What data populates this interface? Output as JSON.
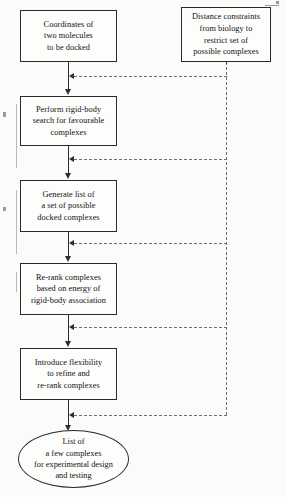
{
  "diagram": {
    "background_color": "#fbfbfa",
    "line_color": "#2f2f2f",
    "dashed_line_color": "#6f6f6f",
    "nodes": {
      "input_coordinates": {
        "label": "Coordinates of\ntwo molecules\nto be docked",
        "shape": "rectangle"
      },
      "distance_constraints": {
        "label": "Distance constraints\nfrom biology  to\nrestrict set of\npossible complexes",
        "shape": "rectangle"
      },
      "rigid_body_search": {
        "label": "Perform rigid-body\nsearch for favourable\ncomplexes",
        "shape": "rectangle"
      },
      "generate_list": {
        "label": "Generate list of\na set of possible\ndocked complexes",
        "shape": "rectangle"
      },
      "rerank_energy": {
        "label": "Re-rank complexes\nbased on energy of\nrigid-body association",
        "shape": "rectangle"
      },
      "introduce_flexibility": {
        "label": "Introduce flexibility\nto refine and\nre-rank complexes",
        "shape": "rectangle"
      },
      "output_list": {
        "label": "List of\na few complexes\nfor experimental design\nand testing",
        "shape": "ellipse"
      }
    },
    "edges": [
      {
        "name": "coordinates-to-rigid-search",
        "style": "solid",
        "direction": "down"
      },
      {
        "name": "rigid-search-to-generate-list",
        "style": "solid",
        "direction": "down"
      },
      {
        "name": "generate-list-to-rerank",
        "style": "solid",
        "direction": "down"
      },
      {
        "name": "rerank-to-flexibility",
        "style": "solid",
        "direction": "down"
      },
      {
        "name": "flexibility-to-output",
        "style": "solid",
        "direction": "down"
      },
      {
        "name": "constraints-branch-1",
        "style": "dashed",
        "direction": "left"
      },
      {
        "name": "constraints-branch-2",
        "style": "dashed",
        "direction": "left"
      },
      {
        "name": "constraints-branch-3",
        "style": "dashed",
        "direction": "left"
      },
      {
        "name": "constraints-branch-4",
        "style": "dashed",
        "direction": "left"
      },
      {
        "name": "constraints-branch-5",
        "style": "dashed",
        "direction": "left"
      }
    ]
  }
}
